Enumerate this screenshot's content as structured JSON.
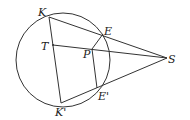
{
  "diagram": {
    "type": "geometry",
    "labels": {
      "K": "K",
      "E": "E",
      "T": "T",
      "P": "P",
      "S": "S",
      "K_prime": "K'",
      "E_prime": "E'"
    },
    "circle": {
      "cx": 63,
      "cy": 60,
      "r": 47
    },
    "points": {
      "K": [
        49,
        17
      ],
      "E": [
        103,
        34
      ],
      "T": [
        53,
        45
      ],
      "P": [
        92,
        49
      ],
      "S": [
        167,
        58
      ],
      "K_prime": [
        61,
        103
      ],
      "E_prime": [
        97,
        88
      ]
    },
    "segments": [
      [
        "K",
        "S"
      ],
      [
        "K",
        "K_prime"
      ],
      [
        "T",
        "S"
      ],
      [
        "K_prime",
        "S"
      ],
      [
        "E",
        "P"
      ],
      [
        "P",
        "E_prime"
      ]
    ],
    "stroke_color": "#333333"
  }
}
